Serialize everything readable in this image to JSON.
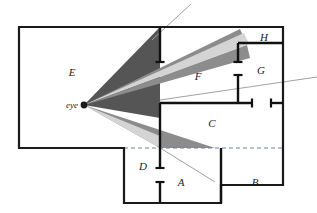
{
  "figure": {
    "width": 317,
    "height": 213,
    "background_color": "#ffffff"
  },
  "colors": {
    "outline": "#1a1a1a",
    "wall": "#111111",
    "beam_dark": "#555555",
    "beam_medium": "#8c8c8c",
    "beam_light": "#d4d4d4",
    "ray_line": "#a0a0a0",
    "dashed_line": "#6e7fa0",
    "label_text": "#1a1a1a"
  },
  "viewpoint": {
    "label": "eye",
    "x": 84,
    "y": 105
  },
  "regions": [
    {
      "id": "region-a",
      "label": "A",
      "x": 181,
      "y": 186
    },
    {
      "id": "region-b",
      "label": "B",
      "x": 255,
      "y": 186
    },
    {
      "id": "region-c",
      "label": "C",
      "x": 212,
      "y": 127
    },
    {
      "id": "region-d",
      "label": "D",
      "x": 143,
      "y": 170
    },
    {
      "id": "region-e",
      "label": "E",
      "x": 72,
      "y": 76
    },
    {
      "id": "region-f",
      "label": "F",
      "x": 198,
      "y": 80
    },
    {
      "id": "region-g",
      "label": "G",
      "x": 261,
      "y": 74
    },
    {
      "id": "region-h",
      "label": "H",
      "x": 264,
      "y": 41
    }
  ],
  "outline": {
    "name": "floor-plan-outline",
    "points": "19,27 283,27 283,185 221,185 221,203 124,203 124,148 19,148"
  },
  "dashed_segment": {
    "name": "dashed-divider",
    "x1": 124,
    "y1": 148,
    "x2": 283,
    "y2": 148
  },
  "walls": [
    {
      "name": "wall-vertical-main-upper",
      "x1": 160,
      "y1": 27,
      "x2": 160,
      "y2": 62,
      "cap": "bottom"
    },
    {
      "name": "wall-vertical-main-lower",
      "x1": 160,
      "y1": 103,
      "x2": 160,
      "y2": 148,
      "cap": "none"
    },
    {
      "name": "wall-horizontal-c",
      "x1": 160,
      "y1": 103,
      "x2": 252,
      "y2": 103,
      "cap": "right"
    },
    {
      "name": "wall-vertical-g",
      "x1": 238,
      "y1": 75,
      "x2": 238,
      "y2": 103,
      "cap": "top"
    },
    {
      "name": "wall-vertical-h",
      "x1": 238,
      "y1": 43,
      "x2": 238,
      "y2": 62,
      "cap": "bottom"
    },
    {
      "name": "wall-horizontal-h",
      "x1": 238,
      "y1": 43,
      "x2": 283,
      "y2": 43,
      "cap": "none"
    },
    {
      "name": "wall-stub-right-edge",
      "x1": 271,
      "y1": 103,
      "x2": 283,
      "y2": 103,
      "cap": "left"
    },
    {
      "name": "wall-vertical-d-upper",
      "x1": 160,
      "y1": 148,
      "x2": 160,
      "y2": 168,
      "cap": "bottom"
    },
    {
      "name": "wall-vertical-d-lower",
      "x1": 160,
      "y1": 182,
      "x2": 160,
      "y2": 203,
      "cap": "top"
    },
    {
      "name": "wall-vertical-b-divider",
      "x1": 221,
      "y1": 148,
      "x2": 221,
      "y2": 203,
      "cap": "none"
    }
  ],
  "beams": [
    {
      "name": "beam-upper-dark",
      "shade": "beam_dark",
      "points": "84,105 160,27 160,118"
    },
    {
      "name": "beam-mid-upper-medium",
      "shade": "beam_medium",
      "points": "84,105 240,29 245,40"
    },
    {
      "name": "beam-mid-light",
      "shade": "beam_light",
      "points": "84,105 244,33 249,44"
    },
    {
      "name": "beam-lower-medium",
      "shade": "beam_medium",
      "points": "84,105 247,45 250,58"
    },
    {
      "name": "beam-bottom-medium",
      "shade": "beam_medium",
      "points": "84,105 215,148 160,148"
    },
    {
      "name": "beam-bottom-light",
      "shade": "beam_light",
      "points": "84,105 160,136 160,148"
    }
  ],
  "rays": [
    {
      "name": "ray-upper-left",
      "x1": 191,
      "y1": 4,
      "x2": 152,
      "y2": 40
    },
    {
      "name": "ray-right-exit",
      "x1": 160,
      "y1": 100,
      "x2": 317,
      "y2": 77
    },
    {
      "name": "ray-lower-right",
      "x1": 157,
      "y1": 146,
      "x2": 215,
      "y2": 182
    }
  ]
}
